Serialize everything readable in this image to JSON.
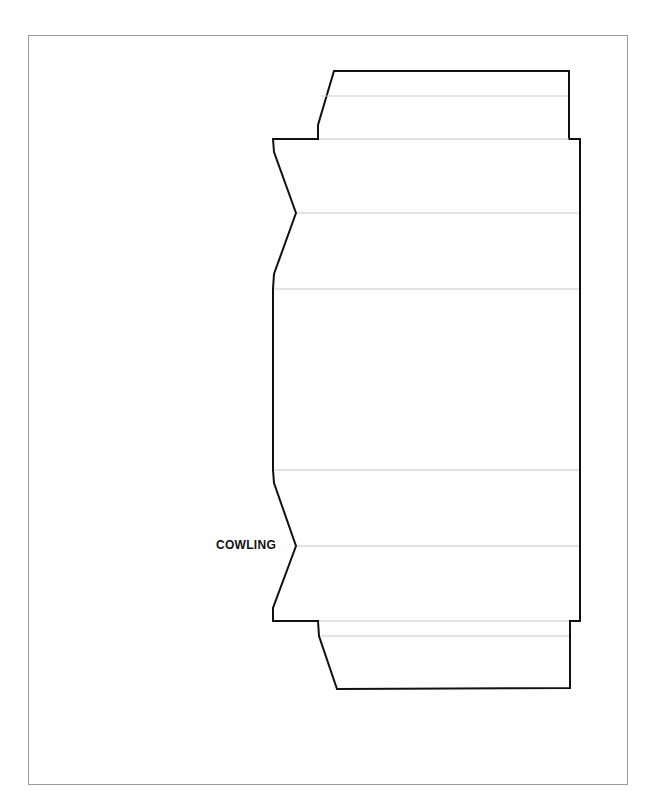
{
  "diagram": {
    "type": "papercraft-template",
    "part_label": "COWLING",
    "colors": {
      "cut_line": "#111111",
      "fold_line": "#c8c8c8",
      "frame": "#9a9a9a",
      "background": "#ffffff"
    },
    "outline_points": [
      [
        334,
        71
      ],
      [
        569,
        71
      ],
      [
        569,
        139
      ],
      [
        580,
        139
      ],
      [
        580,
        621
      ],
      [
        570,
        621
      ],
      [
        570,
        688
      ],
      [
        337,
        689
      ],
      [
        319,
        636
      ],
      [
        318,
        621
      ],
      [
        273,
        621
      ],
      [
        273,
        608
      ],
      [
        296,
        546
      ],
      [
        274,
        483
      ],
      [
        273,
        470
      ],
      [
        273,
        289
      ],
      [
        274,
        274
      ],
      [
        296,
        213
      ],
      [
        274,
        152
      ],
      [
        273,
        139
      ],
      [
        318,
        139
      ],
      [
        318,
        125
      ]
    ],
    "fold_lines_y": [
      96,
      139,
      213,
      289,
      470,
      546,
      621,
      636
    ]
  }
}
